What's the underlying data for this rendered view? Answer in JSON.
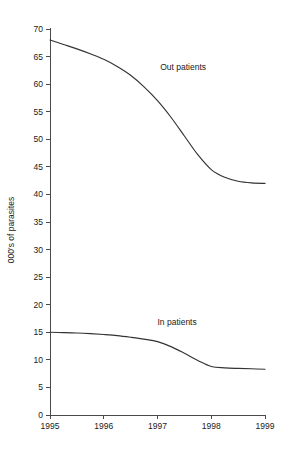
{
  "chart_data": {
    "type": "line",
    "title": "",
    "xlabel": "",
    "ylabel": "000's of parasites",
    "x": [
      1995,
      1996,
      1997,
      1998,
      1999
    ],
    "xtick_labels": [
      "1995",
      "1996",
      "1997",
      "1998",
      "1999"
    ],
    "xlim": [
      1995,
      1999
    ],
    "ylim": [
      0,
      70
    ],
    "ytick_labels": [
      "0",
      "5",
      "10",
      "15",
      "20",
      "25",
      "30",
      "35",
      "40",
      "45",
      "50",
      "55",
      "60",
      "65",
      "70"
    ],
    "ytick_values": [
      0,
      5,
      10,
      15,
      20,
      25,
      30,
      35,
      40,
      45,
      50,
      55,
      60,
      65,
      70
    ],
    "grid": false,
    "legend_position": "inline-annotation",
    "line_color": "#333333",
    "axis_color": "#4a4a4a",
    "background_color": "#ffffff",
    "series": [
      {
        "name": "Out patients",
        "label_x": 1997.05,
        "label_y": 62.5,
        "values": [
          68.0,
          64.5,
          57.0,
          44.5,
          42.0
        ],
        "dense_x": [
          1995.0,
          1995.25,
          1995.5,
          1995.75,
          1996.0,
          1996.25,
          1996.5,
          1996.75,
          1997.0,
          1997.25,
          1997.5,
          1997.75,
          1998.0,
          1998.25,
          1998.5,
          1998.75,
          1999.0
        ],
        "dense_y": [
          68.0,
          67.2,
          66.4,
          65.5,
          64.5,
          63.2,
          61.6,
          59.5,
          57.0,
          54.0,
          50.6,
          47.2,
          44.5,
          43.1,
          42.4,
          42.1,
          42.0
        ]
      },
      {
        "name": "In patients",
        "label_x": 1997.0,
        "label_y": 16.3,
        "values": [
          15.0,
          14.6,
          13.3,
          8.8,
          8.3
        ],
        "dense_x": [
          1995.0,
          1995.25,
          1995.5,
          1995.75,
          1996.0,
          1996.25,
          1996.5,
          1996.75,
          1997.0,
          1997.25,
          1997.5,
          1997.75,
          1998.0,
          1998.25,
          1998.5,
          1998.75,
          1999.0
        ],
        "dense_y": [
          15.0,
          14.95,
          14.88,
          14.76,
          14.6,
          14.4,
          14.1,
          13.75,
          13.3,
          12.4,
          11.2,
          9.9,
          8.8,
          8.55,
          8.45,
          8.38,
          8.3
        ]
      }
    ]
  },
  "geometry": {
    "plot_left": 50,
    "plot_right": 265,
    "plot_top": 29,
    "plot_bottom": 415,
    "tick_length": 4,
    "y_label_x": 14,
    "y_label_y": 230
  }
}
